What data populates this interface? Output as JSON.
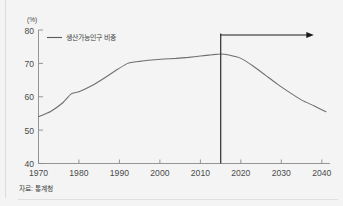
{
  "figure": {
    "unit_label": "(%)",
    "source_note": "자료: 통계청",
    "legend_label": "생산가능인구 비중",
    "line_color": "#6e6e6e",
    "marker_color": "#1a1a1a",
    "axis_color": "#8a8a8a",
    "background_color": "#f4f4f4"
  },
  "chart_data": {
    "type": "line",
    "title": "",
    "subtitle": "",
    "xlabel": "",
    "ylabel": "(%)",
    "xlim": [
      1970,
      2042
    ],
    "ylim": [
      40,
      80
    ],
    "xticks": [
      1970,
      1980,
      1990,
      2000,
      2010,
      2020,
      2030,
      2040
    ],
    "yticks": [
      40,
      50,
      60,
      70,
      80
    ],
    "xtick_labels": [
      "1970",
      "1980",
      "1990",
      "2000",
      "2010",
      "2020",
      "2030",
      "2040"
    ],
    "ytick_labels": [
      "40",
      "50",
      "60",
      "70",
      "80"
    ],
    "grid": false,
    "legend_position": "top-left-inside",
    "series": [
      {
        "name": "생산가능인구 비중",
        "color": "#6e6e6e",
        "x": [
          1970,
          1973,
          1976,
          1978,
          1980,
          1983,
          1986,
          1989,
          1992,
          1995,
          1998,
          2001,
          2004,
          2007,
          2010,
          2013,
          2015,
          2017,
          2020,
          2023,
          2026,
          2029,
          2032,
          2035,
          2038,
          2041
        ],
        "values": [
          54.0,
          55.6,
          58.2,
          60.8,
          61.5,
          63.2,
          65.4,
          67.8,
          70.0,
          70.6,
          71.0,
          71.3,
          71.5,
          71.8,
          72.2,
          72.6,
          72.8,
          72.5,
          71.5,
          69.2,
          66.5,
          63.8,
          61.3,
          59.0,
          57.3,
          55.5
        ]
      }
    ],
    "annotations": [
      {
        "type": "vertical-line",
        "x": 2015,
        "label": "",
        "color": "#1a1a1a",
        "description": "projection start marker at 2015"
      },
      {
        "type": "arrow",
        "from_x": 2015,
        "to_x": 2038,
        "at_y": 78.5,
        "direction": "right",
        "color": "#1a1a1a",
        "description": "rightward arrow indicating projected period"
      }
    ]
  }
}
